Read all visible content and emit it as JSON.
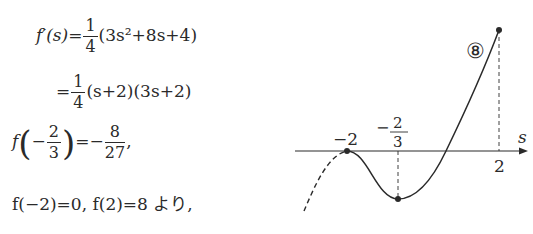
{
  "equations": {
    "line1": {
      "lhs": "f′(s)",
      "eq": "=",
      "frac_num": "1",
      "frac_den": "4",
      "rest": "(3s²+8s+4)"
    },
    "line2": {
      "eq": "=",
      "frac_num": "1",
      "frac_den": "4",
      "rest": "(s+2)(3s+2)"
    },
    "line3": {
      "f": "f",
      "minus": "−",
      "arg_num": "2",
      "arg_den": "3",
      "eq": "=−",
      "val_num": "8",
      "val_den": "27",
      "tail": ","
    },
    "line4": "f(−2)=0,  f(2)=8 より,"
  },
  "graph": {
    "axis_label": "s",
    "tick_labels": {
      "minus2": "−2",
      "minus2_3_num": "2",
      "minus2_3_den": "3",
      "minus2_3_sign": "−",
      "two": "2"
    },
    "circled_label": "⑧",
    "points": [
      {
        "s": -2,
        "f": 0
      },
      {
        "s": -0.6667,
        "f": -0.2963
      },
      {
        "s": 2,
        "f": 8
      }
    ],
    "color": "#2a2a2a"
  }
}
